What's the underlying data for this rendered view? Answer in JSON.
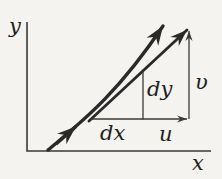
{
  "figure": {
    "labels": {
      "y_axis": "y",
      "x_axis": "x",
      "dx": "dx",
      "dy": "dy",
      "u": "u",
      "v": "υ"
    },
    "colors": {
      "ink_thick": "#2a2a2a",
      "ink_thin": "#3a3a3a",
      "text": "#1e1e1e",
      "background": "#f4f3ef"
    }
  }
}
